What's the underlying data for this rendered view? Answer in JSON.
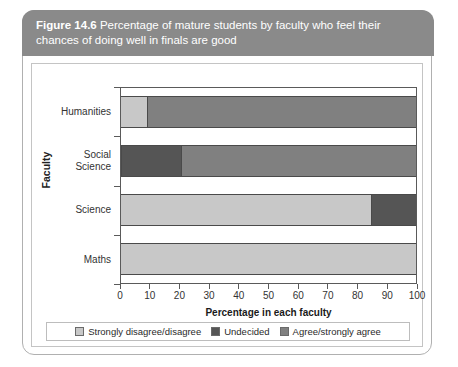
{
  "figure": {
    "number_label": "Figure 14.6",
    "caption": "Percentage of mature students by faculty who feel their chances of doing well in finals are good"
  },
  "chart_data": {
    "type": "bar",
    "orientation": "horizontal",
    "stacked": true,
    "title": "",
    "xlabel": "Percentage in each faculty",
    "ylabel": "Faculty",
    "categories": [
      "Humanities",
      "Social\nScience",
      "Science",
      "Maths"
    ],
    "category_labels": [
      "Humanities",
      "Social Science",
      "Science",
      "Maths"
    ],
    "series": [
      {
        "name": "Strongly disagree/disagree",
        "color": "#c8c8c8",
        "values": [
          9,
          0,
          85,
          100
        ]
      },
      {
        "name": "Undecided",
        "color": "#555555",
        "values": [
          0,
          20,
          15,
          0
        ]
      },
      {
        "name": "Agree/strongly agree",
        "color": "#808080",
        "values": [
          91,
          80,
          0,
          0
        ]
      }
    ],
    "xlim": [
      0,
      100
    ],
    "xticks": [
      0,
      10,
      20,
      30,
      40,
      50,
      60,
      70,
      80,
      90,
      100
    ],
    "xtick_labels": [
      "0",
      "10",
      "20",
      "30",
      "40",
      "50",
      "60",
      "70",
      "80",
      "90",
      "100"
    ],
    "grid": false,
    "legend_position": "bottom"
  },
  "legend": {
    "items": [
      {
        "label": "Strongly disagree/disagree",
        "color": "#c8c8c8"
      },
      {
        "label": "Undecided",
        "color": "#555555"
      },
      {
        "label": "Agree/strongly agree",
        "color": "#808080"
      }
    ]
  },
  "colors": {
    "banner_background": "#8a8a8a",
    "banner_text": "#ffffff",
    "frame_border": "#b0b0b0",
    "axis": "#5a5a5a"
  }
}
